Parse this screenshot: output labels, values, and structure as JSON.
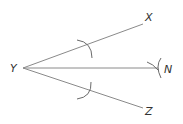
{
  "diagram": {
    "points": {
      "vertex": {
        "label": "Y"
      },
      "arm_upper": {
        "label": "X"
      },
      "bisector": {
        "label": "N"
      },
      "arm_lower": {
        "label": "Z"
      }
    },
    "segments": [
      "YX",
      "YN",
      "YZ"
    ],
    "construction_arcs": [
      {
        "description": "arc centered at Y crossing YX"
      },
      {
        "description": "arc centered at Y crossing YZ"
      },
      {
        "description": "intersecting arcs locating N"
      }
    ],
    "colors": {
      "line": "#8a8a8a",
      "arc": "#6a6a6a",
      "label": "#333333",
      "background": "#ffffff"
    }
  }
}
